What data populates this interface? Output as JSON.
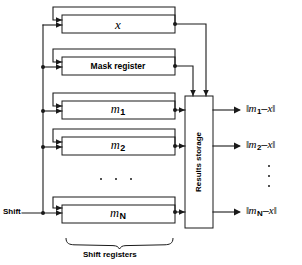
{
  "figure": {
    "background_color": "#ffffff",
    "line_color": "#1a1a1a"
  },
  "registers": [
    {
      "id": "x",
      "label": "x",
      "style": "italic"
    },
    {
      "id": "mask",
      "label": "Mask register",
      "style": "bold"
    },
    {
      "id": "m1",
      "label": "m",
      "subscript": "1",
      "style": "italic"
    },
    {
      "id": "m2",
      "label": "m",
      "subscript": "2",
      "style": "italic"
    },
    {
      "id": "mN",
      "label": "m",
      "subscript": "N",
      "style": "italic"
    }
  ],
  "storage": {
    "label": "Results storage",
    "orientation": "vertical"
  },
  "inputs": {
    "shift_label": "Shift"
  },
  "group_brace": {
    "label": "Shift registers"
  },
  "outputs": [
    {
      "id": "out1",
      "open": "‖",
      "base": "m",
      "subscript": "1",
      "op": "–",
      "operand": "x",
      "close": "‖"
    },
    {
      "id": "out2",
      "open": "‖",
      "base": "m",
      "subscript": "2",
      "op": "–",
      "operand": "x",
      "close": "‖"
    },
    {
      "id": "outN",
      "open": "‖",
      "base": "m",
      "subscript": "N",
      "op": "–",
      "operand": "x",
      "close": "‖"
    }
  ],
  "ellipses": {
    "registers_horizontal": "• • •",
    "outputs_vertical": "• • •"
  }
}
